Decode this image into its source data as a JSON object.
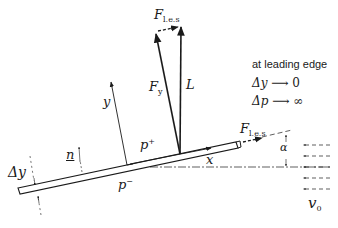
{
  "diagram": {
    "labels": {
      "f_les_top": {
        "base": "F",
        "sub": "l.e.s"
      },
      "f_les_right": {
        "base": "F",
        "sub": "l.e.s"
      },
      "f_y": {
        "base": "F",
        "sub": "y"
      },
      "lift": "L",
      "y_axis": "y",
      "x_axis": "x",
      "normal": "n",
      "p_plus": {
        "base": "p",
        "sup": "+"
      },
      "p_minus": {
        "base": "p",
        "sup": "−"
      },
      "delta_y": "Δy",
      "alpha": "α",
      "v0": {
        "base": "v",
        "sub": "0"
      }
    },
    "note": {
      "title": "at leading edge",
      "line1": {
        "lhs": "Δy",
        "arrow": "⟶",
        "rhs": "0"
      },
      "line2": {
        "lhs": "Δp",
        "arrow": "⟶",
        "rhs": "∞"
      }
    },
    "colors": {
      "ink": "#1a1a1a",
      "background": "#ffffff"
    }
  }
}
